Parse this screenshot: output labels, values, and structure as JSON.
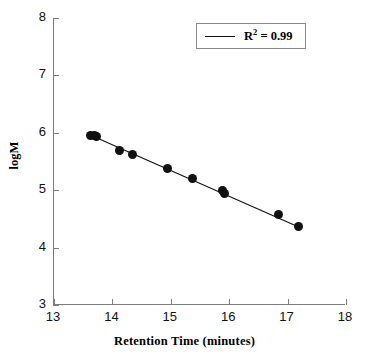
{
  "chart_data": {
    "type": "scatter",
    "title": "",
    "xlabel": "Retention Time (minutes)",
    "ylabel": "logM",
    "xlim": [
      13,
      18
    ],
    "ylim": [
      3,
      8
    ],
    "xticks": [
      "13",
      "14",
      "15",
      "16",
      "17",
      "18"
    ],
    "yticks": [
      "3",
      "4",
      "5",
      "6",
      "7",
      "8"
    ],
    "grid": false,
    "legend_position": "top-right",
    "legend": [
      {
        "label": "R2 = 0.99",
        "label_prefix": "R",
        "label_superscript": "2",
        "label_suffix": " = 0.99",
        "marker": "line",
        "color": "#111111"
      }
    ],
    "series": [
      {
        "name": "Calibration points",
        "marker": "filled-circle",
        "color": "#111111",
        "x": [
          13.62,
          13.7,
          13.72,
          14.13,
          14.34,
          14.95,
          15.38,
          15.88,
          15.92,
          16.84,
          17.19
        ],
        "y": [
          5.96,
          5.95,
          5.93,
          5.7,
          5.63,
          5.38,
          5.2,
          5.0,
          4.95,
          4.58,
          4.36
        ]
      }
    ],
    "fit_line": {
      "name": "Linear regression",
      "color": "#111111",
      "r_squared": 0.99,
      "x_start": 13.62,
      "y_start": 5.96,
      "x_end": 17.19,
      "y_end": 4.36
    },
    "axis_color": "#7d7d7d"
  }
}
